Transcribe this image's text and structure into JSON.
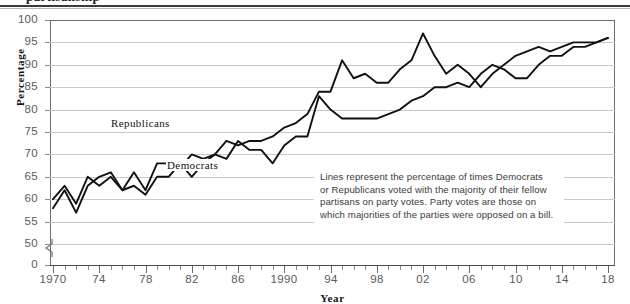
{
  "chart_data": {
    "type": "line",
    "title": "",
    "xlabel": "Year",
    "ylabel": "Percentage",
    "xlim": [
      1970,
      2018
    ],
    "ylim": [
      50,
      100
    ],
    "y_axis_has_break": true,
    "y_break_label": "0",
    "grid": true,
    "legend": "inline-labels",
    "yticks": [
      0,
      50,
      55,
      60,
      65,
      70,
      75,
      80,
      85,
      90,
      95,
      100
    ],
    "ytick_labels": [
      "0",
      "50",
      "55",
      "60",
      "65",
      "70",
      "75",
      "80",
      "85",
      "90",
      "95",
      "100"
    ],
    "xticks": [
      1970,
      1974,
      1978,
      1982,
      1986,
      1990,
      1994,
      1998,
      2002,
      2006,
      2010,
      2014,
      2018
    ],
    "xtick_labels": [
      "1970",
      "74",
      "78",
      "82",
      "86",
      "1990",
      "94",
      "98",
      "02",
      "06",
      "10",
      "14",
      "18"
    ],
    "x": [
      1970,
      1971,
      1972,
      1973,
      1974,
      1975,
      1976,
      1977,
      1978,
      1979,
      1980,
      1981,
      1982,
      1983,
      1984,
      1985,
      1986,
      1987,
      1988,
      1989,
      1990,
      1991,
      1992,
      1993,
      1994,
      1995,
      1996,
      1997,
      1998,
      1999,
      2000,
      2001,
      2002,
      2003,
      2004,
      2005,
      2006,
      2007,
      2008,
      2009,
      2010,
      2011,
      2012,
      2013,
      2014,
      2015,
      2016,
      2017,
      2018
    ],
    "series": [
      {
        "name": "Democrats",
        "color": "#111111",
        "values": [
          58,
          62,
          57,
          63,
          65,
          66,
          62,
          63,
          61,
          65,
          65,
          68,
          65,
          68,
          70,
          69,
          73,
          71,
          71,
          68,
          72,
          74,
          74,
          83,
          80,
          78,
          78,
          78,
          78,
          79,
          80,
          82,
          83,
          85,
          85,
          86,
          85,
          88,
          90,
          89,
          87,
          87,
          90,
          92,
          92,
          94,
          94,
          95,
          96
        ]
      },
      {
        "name": "Republicans",
        "color": "#111111",
        "values": [
          60,
          63,
          59,
          65,
          63,
          65,
          62,
          66,
          62,
          68,
          68,
          67,
          70,
          69,
          70,
          73,
          72,
          73,
          73,
          74,
          76,
          77,
          79,
          84,
          84,
          91,
          87,
          88,
          86,
          86,
          89,
          91,
          97,
          92,
          88,
          90,
          88,
          85,
          88,
          90,
          92,
          93,
          94,
          93,
          94,
          95,
          95,
          95,
          96
        ]
      }
    ],
    "annotation": {
      "lines": [
        "Lines represent the percentage of times Democrats",
        "or Republicans voted with the majority of their fellow",
        "partisans on party votes. Party votes are those on",
        "which majorities of the parties were opposed on a bill."
      ]
    }
  },
  "labels": {
    "republicans": "Republicans",
    "democrats": "Democrats",
    "yaxis_title": "Percentage",
    "xaxis_title": "Year"
  },
  "top_cut_text": "partisanship"
}
